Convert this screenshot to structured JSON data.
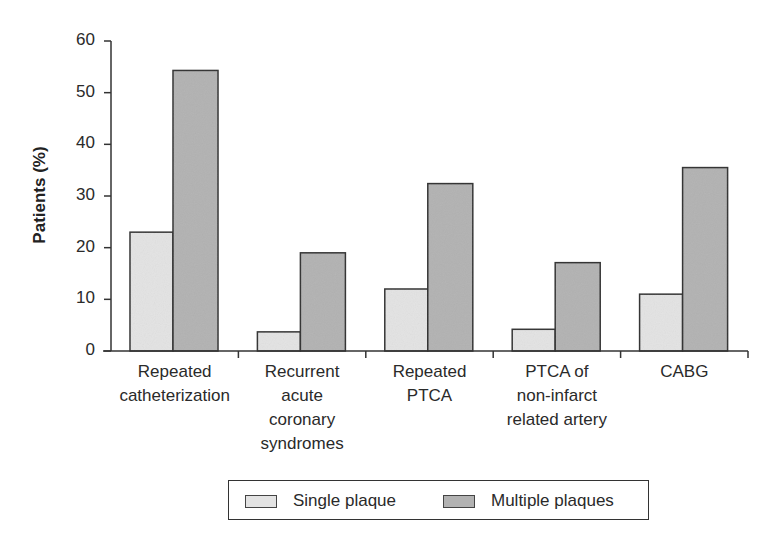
{
  "chart_data": {
    "type": "bar",
    "title": "",
    "xlabel": "",
    "ylabel": "Patients (%)",
    "ylim": [
      0,
      60
    ],
    "yticks": [
      0,
      10,
      20,
      30,
      40,
      50,
      60
    ],
    "grid": false,
    "legend_position": "bottom",
    "categories": [
      "Repeated catheterization",
      "Recurrent acute coronary syndromes",
      "Repeated PTCA",
      "PTCA of non-infarct related artery",
      "CABG"
    ],
    "category_lines": [
      [
        "Repeated",
        "catheterization"
      ],
      [
        "Recurrent",
        "acute",
        "coronary",
        "syndromes"
      ],
      [
        "Repeated",
        "PTCA"
      ],
      [
        "PTCA of",
        "non-infarct",
        "related artery"
      ],
      [
        "CABG"
      ]
    ],
    "series": [
      {
        "name": "Single plaque",
        "color": "#e3e3e3",
        "values": [
          23,
          3.7,
          12,
          4.2,
          11
        ]
      },
      {
        "name": "Multiple plaques",
        "color": "#b2b2b2",
        "values": [
          54.3,
          19,
          32.4,
          17.1,
          35.5
        ]
      }
    ]
  },
  "legend": {
    "items": [
      {
        "label": "Single plaque",
        "color": "#e3e3e3"
      },
      {
        "label": "Multiple plaques",
        "color": "#b2b2b2"
      }
    ]
  }
}
